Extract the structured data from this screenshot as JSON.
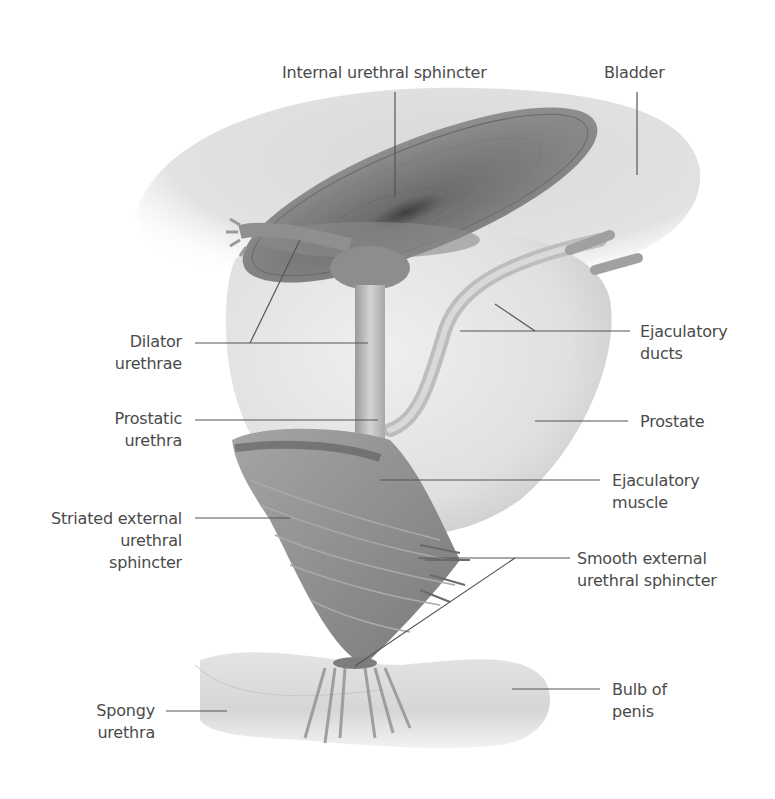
{
  "figure": {
    "colors": {
      "background": "#ffffff",
      "text": "#4a4a4a",
      "leader": "#555555",
      "muscle": "#8a8a8a",
      "muscle_dark": "#5e5e5e",
      "organ_light": "#e6e6e6",
      "organ_mid": "#cfcfcf"
    }
  },
  "labels": {
    "internal_urethral_sphincter": "Internal urethral sphincter",
    "bladder": "Bladder",
    "dilator_urethrae": "Dilator\nurethrae",
    "prostatic_urethra": "Prostatic\nurethra",
    "ejaculatory_ducts": "Ejaculatory\nducts",
    "prostate": "Prostate",
    "ejaculatory_muscle": "Ejaculatory\nmuscle",
    "striated_external_urethral_sphincter": "Striated external\nurethral\nsphincter",
    "smooth_external_urethral_sphincter": "Smooth external\nurethral sphincter",
    "spongy_urethra": "Spongy\nurethra",
    "bulb_of_penis": "Bulb of\npenis"
  }
}
